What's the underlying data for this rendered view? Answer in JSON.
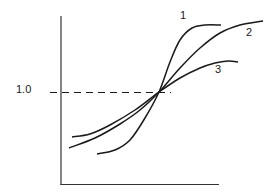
{
  "chart_data": {
    "type": "line",
    "title": "",
    "xlabel": "",
    "ylabel": "",
    "yticks": [
      "1.0"
    ],
    "reference_line": {
      "y": 1.0,
      "style": "dashed",
      "label": "1.0"
    },
    "grid": false,
    "legend": "inline curve labels",
    "series": [
      {
        "name": "1",
        "label": "1",
        "description": "steepest sigmoid",
        "points": [
          [
            97,
            154
          ],
          [
            115,
            150
          ],
          [
            130,
            140
          ],
          [
            145,
            118
          ],
          [
            159,
            92
          ],
          [
            170,
            62
          ],
          [
            180,
            40
          ],
          [
            192,
            28
          ],
          [
            205,
            25
          ],
          [
            221,
            25
          ]
        ]
      },
      {
        "name": "2",
        "label": "2",
        "description": "intermediate sigmoid",
        "points": [
          [
            69,
            148
          ],
          [
            95,
            138
          ],
          [
            120,
            124
          ],
          [
            140,
            110
          ],
          [
            159,
            92
          ],
          [
            180,
            68
          ],
          [
            200,
            48
          ],
          [
            220,
            33
          ],
          [
            240,
            25
          ],
          [
            263,
            21
          ]
        ]
      },
      {
        "name": "3",
        "label": "3",
        "description": "flattest sigmoid",
        "points": [
          [
            72,
            137
          ],
          [
            90,
            134
          ],
          [
            110,
            125
          ],
          [
            135,
            110
          ],
          [
            159,
            92
          ],
          [
            180,
            78
          ],
          [
            200,
            68
          ],
          [
            215,
            63
          ],
          [
            228,
            61
          ],
          [
            238,
            62
          ]
        ]
      }
    ],
    "intersection": {
      "x": 159,
      "y": 92,
      "value": 1.0
    }
  },
  "labels": {
    "ytick": "1.0",
    "curve1": "1",
    "curve2": "2",
    "curve3": "3"
  },
  "colors": {
    "line": "#1a1a1a",
    "axis": "#333333",
    "background": "#ffffff"
  }
}
